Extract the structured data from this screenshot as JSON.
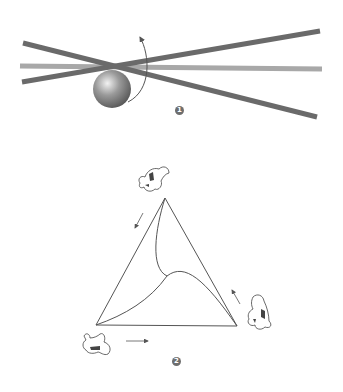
{
  "figure1": {
    "label": "1",
    "badge_position": {
      "x": 179,
      "y": 110
    },
    "colors": {
      "rod_dark": "#6a6a6a",
      "rod_light": "#a8a8a8",
      "sphere": "#7a7a7a",
      "arrow": "#555555"
    },
    "rods": [
      {
        "name": "rod-horizontal",
        "x1": 20,
        "y1": 66,
        "x2": 322,
        "y2": 69,
        "shade": "light"
      },
      {
        "name": "rod-rising",
        "x1": 22,
        "y1": 82,
        "x2": 320,
        "y2": 31,
        "shade": "dark"
      },
      {
        "name": "rod-falling",
        "x1": 23,
        "y1": 43,
        "x2": 317,
        "y2": 117,
        "shade": "dark"
      }
    ],
    "sphere": {
      "cx": 112,
      "cy": 89,
      "r": 19
    },
    "rotation_arrow": {
      "from": [
        128,
        103
      ],
      "to": [
        140,
        36
      ]
    }
  },
  "figure2": {
    "label": "2",
    "badge_position": {
      "x": 176,
      "y": 361
    },
    "triangle": {
      "top": [
        165,
        198
      ],
      "left": [
        96,
        325
      ],
      "right": [
        237,
        326
      ]
    },
    "dogs": [
      {
        "name": "dog-top",
        "x": 135,
        "y": 165
      },
      {
        "name": "dog-right",
        "x": 243,
        "y": 293
      },
      {
        "name": "dog-left",
        "x": 80,
        "y": 330
      }
    ],
    "arrows": [
      {
        "name": "arrow-top-to-left",
        "from": [
          143,
          213
        ],
        "to": [
          135,
          228
        ]
      },
      {
        "name": "arrow-right-to-top",
        "from": [
          240,
          304
        ],
        "to": [
          232,
          290
        ]
      },
      {
        "name": "arrow-left-to-right",
        "from": [
          126,
          341
        ],
        "to": [
          148,
          341
        ]
      }
    ]
  }
}
